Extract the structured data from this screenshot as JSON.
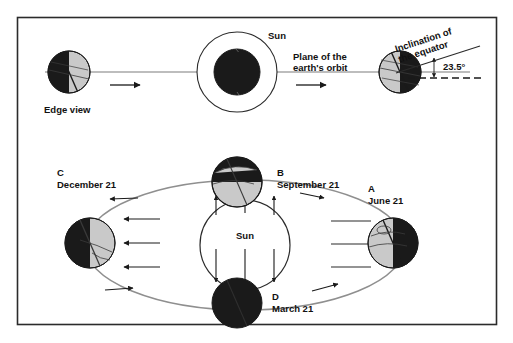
{
  "figure": {
    "title_visible": false,
    "background_color": "#ffffff",
    "frame_color": "#2b2b2b",
    "earth_dark_color": "#1a1a1a",
    "earth_light_color": "#c9c9c9",
    "line_color": "#4a4a4a",
    "orbit_color": "#8a8a8a"
  },
  "top_view": {
    "edge_view_label": "Edge view",
    "sun_label": "Sun",
    "plane_label_line1": "Plane of the",
    "plane_label_line2": "earth's orbit",
    "inclination_label_line1": "Inclination of",
    "inclination_label_line2": "the equator",
    "angle_label": "23.5°"
  },
  "orbit_view": {
    "sun_label": "Sun",
    "positions": [
      {
        "key": "A",
        "letter": "A",
        "date": "June 21",
        "lit_side": "left"
      },
      {
        "key": "B",
        "letter": "B",
        "date": "September 21",
        "lit_side": "bottom"
      },
      {
        "key": "C",
        "letter": "C",
        "date": "December 21",
        "lit_side": "right"
      },
      {
        "key": "D",
        "letter": "D",
        "date": "March 21",
        "lit_side": "none"
      }
    ]
  }
}
